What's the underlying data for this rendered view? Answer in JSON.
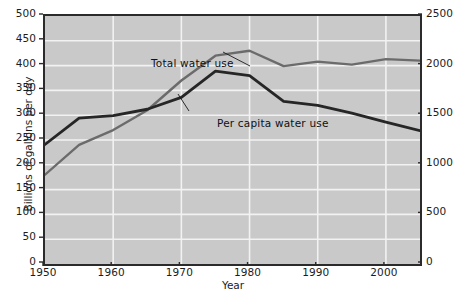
{
  "chart_data": {
    "type": "line",
    "title": "",
    "xlabel": "Year",
    "ylabel": "Billions of gallons per day",
    "ylabel_right": "Gallons per person per day",
    "xlim": [
      1950,
      2005
    ],
    "ylim": [
      0,
      500
    ],
    "ylim_right": [
      0,
      2500
    ],
    "grid": true,
    "legend_position": "in-plot annotations",
    "x_ticks": [
      1950,
      1960,
      1970,
      1980,
      1990,
      2000
    ],
    "x_tick_labels": [
      "1950",
      "1960",
      "1970",
      "1980",
      "1990",
      "2000"
    ],
    "y_ticks_left": [
      0,
      50,
      100,
      150,
      200,
      250,
      300,
      350,
      400,
      450,
      500
    ],
    "y_tick_labels_left": [
      "0",
      "50",
      "100",
      "150",
      "200",
      "250",
      "300",
      "350",
      "400",
      "450",
      "500"
    ],
    "y_ticks_right": [
      0,
      500,
      1000,
      1500,
      2000,
      2500
    ],
    "y_tick_labels_right": [
      "0",
      "500",
      "1000",
      "1500",
      "2000",
      "2500"
    ],
    "x": [
      1950,
      1955,
      1960,
      1965,
      1970,
      1975,
      1980,
      1985,
      1990,
      1995,
      2000,
      2005
    ],
    "series": [
      {
        "name": "Total water use",
        "axis": "left",
        "units": "Billions of gallons per day",
        "color": "#6b6b6b",
        "values": [
          180,
          240,
          270,
          310,
          370,
          420,
          430,
          399,
          408,
          402,
          413,
          410
        ]
      },
      {
        "name": "Per capita water use",
        "axis": "right",
        "units": "Gallons per person per day",
        "color": "#262626",
        "values": [
          1205,
          1470,
          1495,
          1560,
          1680,
          1945,
          1900,
          1640,
          1600,
          1520,
          1430,
          1345
        ]
      }
    ],
    "annotations": [
      {
        "text": "Total water use",
        "target_x": 1975,
        "target_y_left": 420
      },
      {
        "text": "Per capita water use",
        "target_x": 1982,
        "target_y_right": 1800
      }
    ]
  },
  "axes": {
    "left_title": "Billions of gallons per day",
    "right_title": "Gallons per person per day",
    "x_title": "Year"
  },
  "annotations": {
    "total_water_use": "Total water use",
    "per_capita_water_use": "Per capita water use"
  },
  "source": {
    "note": ""
  }
}
